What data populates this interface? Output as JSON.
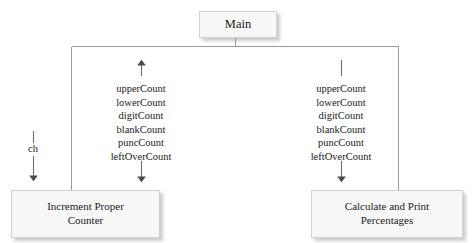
{
  "diagram": {
    "title": "Main",
    "type": "structure-chart",
    "line_color": "#9a9a9a",
    "box_fill": "#f7f7f7",
    "box_border": "#d2d2d2",
    "text_color": "#1b1b1b"
  },
  "modules": {
    "main": {
      "label": "Main"
    },
    "increment": {
      "label": "Increment Proper\nCounter"
    },
    "calculate": {
      "label": "Calculate and Print\nPercentages"
    }
  },
  "couples": {
    "left": {
      "direction_top": "up-arrow",
      "direction_bottom": "down-arrow",
      "items": [
        "upperCount",
        "lowerCount",
        "digitCount",
        "blankCount",
        "puncCount",
        "leftOverCount"
      ]
    },
    "right": {
      "direction_top": "plain-line",
      "direction_bottom": "down-arrow",
      "items": [
        "upperCount",
        "lowerCount",
        "digitCount",
        "blankCount",
        "puncCount",
        "leftOverCount"
      ]
    },
    "ch": {
      "label": "ch",
      "direction_bottom": "down-arrow"
    }
  }
}
